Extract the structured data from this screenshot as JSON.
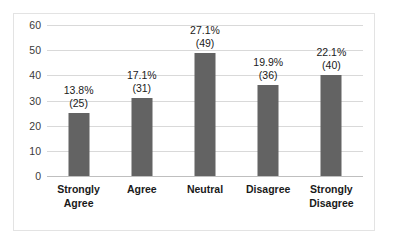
{
  "chart_data": {
    "type": "bar",
    "title": "",
    "subtitle": "",
    "xlabel": "",
    "ylabel": "",
    "categories": [
      "Strongly\nAgree",
      "Agree",
      "Neutral",
      "Disagree",
      "Strongly\nDisagree"
    ],
    "values": [
      25,
      31,
      49,
      36,
      40
    ],
    "percent_labels": [
      "13.8%",
      "17.1%",
      "27.1%",
      "19.9%",
      "22.1%"
    ],
    "count_labels": [
      "(25)",
      "(31)",
      "(49)",
      "(36)",
      "(40)"
    ],
    "percents": [
      13.8,
      17.1,
      27.1,
      19.9,
      22.1
    ],
    "ylim": [
      0,
      60
    ],
    "ytick_labels": [
      "0",
      "10",
      "20",
      "30",
      "40",
      "50",
      "60"
    ],
    "yticks": [
      0,
      10,
      20,
      30,
      40,
      50,
      60
    ],
    "grid": "horizontal",
    "legend": "none",
    "bar_color": "#636363",
    "gridline_color": "#d9d9d9",
    "frame_color": "#e3e3e3",
    "background_color": "#ffffff",
    "text_color": "#1a1a1a"
  }
}
